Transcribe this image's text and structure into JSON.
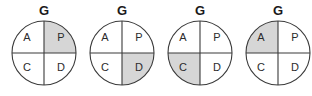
{
  "figure": {
    "type": "quadrant-circle-series",
    "background_color": "#ffffff",
    "stroke_color": "#3a3a3a",
    "shaded_color": "#d6d6d6",
    "unshaded_color": "#ffffff",
    "text_color": "#2b2b2b",
    "top_label_color": "#1a1a1a",
    "quadrant_keys": [
      "A",
      "P",
      "C",
      "D"
    ],
    "quadrant_positions": {
      "A": "top-left",
      "P": "top-right",
      "C": "bottom-left",
      "D": "bottom-right"
    },
    "circles": [
      {
        "index": 1,
        "top_label": "G",
        "shaded_quadrant": "P",
        "quadrants": {
          "top_left": {
            "label": "A",
            "shaded": false
          },
          "top_right": {
            "label": "P",
            "shaded": true
          },
          "bottom_left": {
            "label": "C",
            "shaded": false
          },
          "bottom_right": {
            "label": "D",
            "shaded": false
          }
        }
      },
      {
        "index": 2,
        "top_label": "G",
        "shaded_quadrant": "D",
        "quadrants": {
          "top_left": {
            "label": "A",
            "shaded": false
          },
          "top_right": {
            "label": "P",
            "shaded": false
          },
          "bottom_left": {
            "label": "C",
            "shaded": false
          },
          "bottom_right": {
            "label": "D",
            "shaded": true
          }
        }
      },
      {
        "index": 3,
        "top_label": "G",
        "shaded_quadrant": "C",
        "quadrants": {
          "top_left": {
            "label": "A",
            "shaded": false
          },
          "top_right": {
            "label": "P",
            "shaded": false
          },
          "bottom_left": {
            "label": "C",
            "shaded": true
          },
          "bottom_right": {
            "label": "D",
            "shaded": false
          }
        }
      },
      {
        "index": 4,
        "top_label": "G",
        "shaded_quadrant": "A",
        "quadrants": {
          "top_left": {
            "label": "A",
            "shaded": true
          },
          "top_right": {
            "label": "P",
            "shaded": false
          },
          "bottom_left": {
            "label": "C",
            "shaded": false
          },
          "bottom_right": {
            "label": "D",
            "shaded": false
          }
        }
      }
    ]
  }
}
